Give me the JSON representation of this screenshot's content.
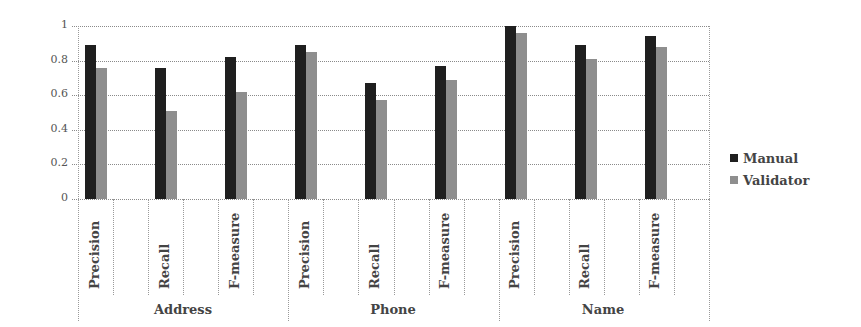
{
  "chart_data": {
    "type": "bar",
    "title": "",
    "xlabel": "",
    "ylabel": "",
    "ylim": [
      0,
      1
    ],
    "yticks": [
      "0",
      "0.2",
      "0.4",
      "0.6",
      "0.8",
      "1"
    ],
    "groups": [
      "Address",
      "Phone",
      "Name"
    ],
    "categories": [
      "Precision",
      "Recall",
      "F-measure",
      "Precision",
      "Recall",
      "F-measure",
      "Precision",
      "Recall",
      "F-measure"
    ],
    "series": [
      {
        "name": "Manual",
        "color": "#1f1f1f",
        "values": [
          0.89,
          0.76,
          0.82,
          0.89,
          0.67,
          0.77,
          1.0,
          0.89,
          0.94
        ]
      },
      {
        "name": "Validator",
        "color": "#8e8e8e",
        "values": [
          0.76,
          0.51,
          0.62,
          0.85,
          0.57,
          0.69,
          0.96,
          0.81,
          0.88
        ]
      }
    ],
    "grid": true,
    "legend_position": "right"
  },
  "legend": {
    "items": [
      {
        "label": "Manual",
        "color": "#1f1f1f"
      },
      {
        "label": "Validator",
        "color": "#8e8e8e"
      }
    ]
  },
  "groups": [
    {
      "label": "Address"
    },
    {
      "label": "Phone"
    },
    {
      "label": "Name"
    }
  ]
}
